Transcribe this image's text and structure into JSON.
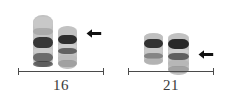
{
  "figure": {
    "type": "karyotype-partial",
    "background_color": "#ffffff",
    "ink_color": "#3a3a3a",
    "arrow_color": "#111111",
    "bracket_color": "#4a4a4a",
    "groups": [
      {
        "id": "group-16",
        "label": "16",
        "label_left": 18,
        "label_top": 78,
        "label_width": 86,
        "bracket_left": 18,
        "bracket_top": 68,
        "bracket_width": 86,
        "arrow": {
          "name": "left-arrow-marker-16",
          "left": 86,
          "top": 28,
          "width": 16,
          "height": 11
        },
        "chromosomes": [
          {
            "id": "chr16-a",
            "left": 33,
            "top": 15,
            "width": 20,
            "height": 52,
            "bands": [
              {
                "top": 2,
                "height": 13,
                "color": "#c9c9c9",
                "opacity": 0.75
              },
              {
                "top": 13,
                "height": 7,
                "color": "#9a9a9a",
                "opacity": 0.6
              },
              {
                "top": 22,
                "height": 11,
                "color": "#2b2b2b",
                "opacity": 0.92
              },
              {
                "top": 33,
                "height": 6,
                "color": "#cfcfcf",
                "opacity": 0.7
              },
              {
                "top": 38,
                "height": 9,
                "color": "#555555",
                "opacity": 0.8
              },
              {
                "top": 46,
                "height": 6,
                "color": "#3a3a3a",
                "opacity": 0.72
              }
            ]
          },
          {
            "id": "chr16-b",
            "left": 58,
            "top": 26,
            "width": 19,
            "height": 43,
            "bands": [
              {
                "top": 1,
                "height": 8,
                "color": "#c4c4c4",
                "opacity": 0.72
              },
              {
                "top": 9,
                "height": 9,
                "color": "#232323",
                "opacity": 0.93
              },
              {
                "top": 18,
                "height": 5,
                "color": "#d2d2d2",
                "opacity": 0.7
              },
              {
                "top": 22,
                "height": 6,
                "color": "#4e4e4e",
                "opacity": 0.82
              },
              {
                "top": 29,
                "height": 6,
                "color": "#b8b8b8",
                "opacity": 0.65
              },
              {
                "top": 34,
                "height": 7,
                "color": "#8a8a8a",
                "opacity": 0.6
              }
            ]
          }
        ]
      },
      {
        "id": "group-21",
        "label": "21",
        "label_left": 128,
        "label_top": 78,
        "label_width": 86,
        "bracket_left": 128,
        "bracket_top": 68,
        "bracket_width": 86,
        "arrow": {
          "name": "left-arrow-marker-21",
          "left": 198,
          "top": 49,
          "width": 16,
          "height": 11
        },
        "chromosomes": [
          {
            "id": "chr21-a",
            "left": 144,
            "top": 33,
            "width": 19,
            "height": 32,
            "bands": [
              {
                "top": 1,
                "height": 6,
                "color": "#bdbdbd",
                "opacity": 0.7
              },
              {
                "top": 6,
                "height": 9,
                "color": "#262626",
                "opacity": 0.92
              },
              {
                "top": 15,
                "height": 6,
                "color": "#cccccc",
                "opacity": 0.68
              },
              {
                "top": 20,
                "height": 6,
                "color": "#6a6a6a",
                "opacity": 0.7
              },
              {
                "top": 25,
                "height": 6,
                "color": "#a8a8a8",
                "opacity": 0.6
              }
            ]
          },
          {
            "id": "chr21-b",
            "left": 168,
            "top": 33,
            "width": 21,
            "height": 42,
            "bands": [
              {
                "top": 1,
                "height": 7,
                "color": "#c2c2c2",
                "opacity": 0.72
              },
              {
                "top": 6,
                "height": 10,
                "color": "#1f1f1f",
                "opacity": 0.94
              },
              {
                "top": 16,
                "height": 5,
                "color": "#d4d4d4",
                "opacity": 0.7
              },
              {
                "top": 20,
                "height": 7,
                "color": "#4a4a4a",
                "opacity": 0.82
              },
              {
                "top": 27,
                "height": 7,
                "color": "#b0b0b0",
                "opacity": 0.62
              },
              {
                "top": 33,
                "height": 7,
                "color": "#8c8c8c",
                "opacity": 0.6
              }
            ]
          }
        ]
      }
    ]
  }
}
